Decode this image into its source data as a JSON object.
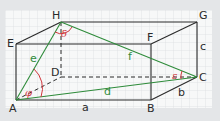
{
  "figure": {
    "type": "cuboid-space-diagonal",
    "colors": {
      "background": "#e4e6e8",
      "grid_paper": "#f7f8f8",
      "grid_lines": "#dde0e2",
      "edges": "#2a2a2a",
      "diagonals": "#2e8b3a",
      "angles": "#d0363c"
    },
    "vertices": {
      "A": "A",
      "B": "B",
      "C": "C",
      "D": "D",
      "E": "E",
      "F": "F",
      "G": "G",
      "H": "H"
    },
    "edge_labels": {
      "a": "a",
      "b": "b",
      "c": "c"
    },
    "diagonal_labels": {
      "d": "d",
      "e": "e",
      "f": "f"
    },
    "angle_labels": {
      "phi": "φ",
      "delta": "δ",
      "epsilon": "ε"
    }
  }
}
